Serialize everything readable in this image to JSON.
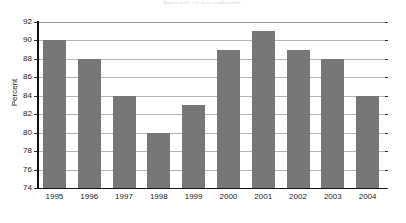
{
  "chart_data": {
    "type": "bar",
    "title": "",
    "title_remnant": "Percent of households",
    "xlabel": "",
    "ylabel": "Percent",
    "categories": [
      "1995",
      "1996",
      "1997",
      "1998",
      "1999",
      "2000",
      "2001",
      "2002",
      "2003",
      "2004"
    ],
    "values": [
      90,
      88,
      84,
      80,
      83,
      89,
      91,
      89,
      88,
      84
    ],
    "series": [
      {
        "name": "Percent",
        "values": [
          90,
          88,
          84,
          80,
          83,
          89,
          91,
          89,
          88,
          84
        ],
        "color": "#77777a"
      }
    ],
    "ylim": [
      74,
      92
    ],
    "ytick_step": 2,
    "yticks": [
      74,
      76,
      78,
      80,
      82,
      84,
      86,
      88,
      90,
      92
    ],
    "ytick_labels": [
      "74",
      "76",
      "78",
      "80",
      "82",
      "84",
      "86",
      "88",
      "90",
      "92"
    ],
    "grid": true,
    "grid_axis": "y",
    "legend": false,
    "legend_position": "none",
    "bar_color": "#77777a",
    "gridline_color": "#b4b4b8",
    "axis_color": "#111111",
    "background_color": "#ffffff",
    "data_labels": false
  },
  "axes": {
    "y_title": "Percent"
  }
}
